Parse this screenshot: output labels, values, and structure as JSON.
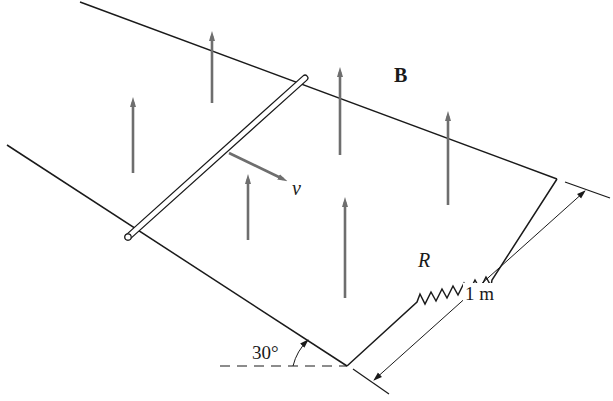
{
  "figure": {
    "labels": {
      "field": "B",
      "velocity": "v",
      "resistor": "R",
      "rail_separation": "1 m",
      "incline_angle": "30°"
    },
    "colors": {
      "line": "#1a1a1a",
      "field_arrow": "#6e6e6e",
      "background": "#ffffff"
    },
    "field_arrows": [
      {
        "x": 133,
        "y_tail": 173,
        "y_head": 98
      },
      {
        "x": 212,
        "y_tail": 103,
        "y_head": 32
      },
      {
        "x": 340,
        "y_tail": 155,
        "y_head": 68
      },
      {
        "x": 248,
        "y_tail": 240,
        "y_head": 175
      },
      {
        "x": 345,
        "y_tail": 298,
        "y_head": 198
      },
      {
        "x": 448,
        "y_tail": 205,
        "y_head": 112
      }
    ]
  }
}
